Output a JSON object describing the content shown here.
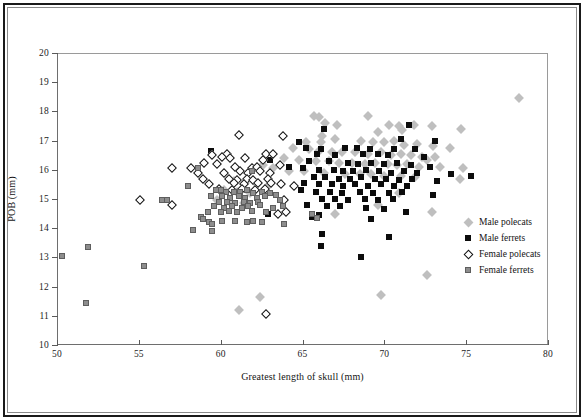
{
  "chart_data": {
    "type": "scatter",
    "title": "",
    "xlabel": "Greatest length of skull (mm)",
    "ylabel": "POB (mm)",
    "xlim": [
      50,
      80
    ],
    "ylim": [
      10,
      20
    ],
    "xticks": [
      50,
      55,
      60,
      65,
      70,
      75,
      80
    ],
    "yticks": [
      10,
      11,
      12,
      13,
      14,
      15,
      16,
      17,
      18,
      19,
      20
    ],
    "grid": false,
    "legend_position": "right-middle",
    "series": [
      {
        "name": "Male polecats",
        "marker": "diamond",
        "color": "#bfbfbf",
        "points": [
          [
            78.2,
            18.45
          ],
          [
            65.7,
            17.85
          ],
          [
            66.0,
            17.8
          ],
          [
            66.4,
            17.6
          ],
          [
            69.0,
            17.85
          ],
          [
            67.1,
            17.55
          ],
          [
            70.3,
            17.55
          ],
          [
            70.9,
            17.5
          ],
          [
            71.8,
            17.55
          ],
          [
            72.9,
            17.5
          ],
          [
            74.7,
            17.4
          ],
          [
            71.1,
            17.35
          ],
          [
            69.6,
            17.3
          ],
          [
            66.2,
            17.15
          ],
          [
            67.0,
            17.05
          ],
          [
            65.2,
            16.95
          ],
          [
            66.1,
            16.95
          ],
          [
            68.6,
            17.0
          ],
          [
            69.3,
            16.95
          ],
          [
            70.0,
            16.95
          ],
          [
            70.6,
            17.0
          ],
          [
            71.2,
            16.85
          ],
          [
            72.0,
            16.9
          ],
          [
            73.0,
            16.8
          ],
          [
            74.0,
            16.75
          ],
          [
            64.4,
            16.75
          ],
          [
            65.4,
            16.7
          ],
          [
            66.0,
            16.65
          ],
          [
            66.8,
            16.6
          ],
          [
            67.4,
            16.6
          ],
          [
            68.2,
            16.6
          ],
          [
            69.0,
            16.55
          ],
          [
            69.8,
            16.6
          ],
          [
            70.4,
            16.5
          ],
          [
            71.0,
            16.55
          ],
          [
            71.6,
            16.5
          ],
          [
            72.3,
            16.45
          ],
          [
            73.1,
            16.45
          ],
          [
            72.6,
            16.35
          ],
          [
            63.9,
            16.4
          ],
          [
            64.8,
            16.35
          ],
          [
            65.8,
            16.3
          ],
          [
            66.6,
            16.3
          ],
          [
            67.2,
            16.25
          ],
          [
            68.0,
            16.25
          ],
          [
            68.8,
            16.2
          ],
          [
            69.4,
            16.25
          ],
          [
            70.2,
            16.2
          ],
          [
            70.8,
            16.15
          ],
          [
            71.4,
            16.2
          ],
          [
            72.1,
            16.1
          ],
          [
            73.4,
            16.1
          ],
          [
            74.8,
            16.05
          ],
          [
            62.6,
            16.15
          ],
          [
            63.2,
            16.05
          ],
          [
            64.2,
            15.95
          ],
          [
            65.1,
            15.95
          ],
          [
            66.3,
            15.9
          ],
          [
            67.6,
            15.85
          ],
          [
            68.5,
            15.85
          ],
          [
            69.2,
            15.85
          ],
          [
            70.0,
            15.8
          ],
          [
            71.0,
            15.8
          ],
          [
            71.9,
            15.75
          ],
          [
            74.6,
            15.7
          ],
          [
            60.8,
            15.6
          ],
          [
            61.5,
            15.55
          ],
          [
            62.2,
            15.5
          ],
          [
            62.9,
            15.45
          ],
          [
            60.2,
            15.3
          ],
          [
            61.0,
            15.25
          ],
          [
            61.8,
            15.2
          ],
          [
            70.9,
            15.2
          ],
          [
            59.8,
            14.95
          ],
          [
            60.6,
            14.9
          ],
          [
            61.4,
            14.85
          ],
          [
            69.6,
            14.8
          ],
          [
            72.9,
            14.55
          ],
          [
            67.0,
            14.5
          ],
          [
            72.6,
            12.4
          ],
          [
            69.8,
            11.7
          ],
          [
            62.4,
            11.65
          ],
          [
            61.1,
            11.2
          ]
        ]
      },
      {
        "name": "Male ferrets",
        "marker": "square",
        "color": "#0c0c0c",
        "points": [
          [
            71.5,
            17.55
          ],
          [
            66.3,
            17.4
          ],
          [
            64.8,
            16.95
          ],
          [
            71.0,
            17.05
          ],
          [
            73.1,
            17.0
          ],
          [
            65.2,
            16.75
          ],
          [
            66.1,
            16.7
          ],
          [
            67.6,
            16.75
          ],
          [
            68.3,
            16.75
          ],
          [
            69.1,
            16.7
          ],
          [
            70.6,
            16.7
          ],
          [
            71.9,
            16.7
          ],
          [
            59.4,
            16.65
          ],
          [
            65.9,
            16.55
          ],
          [
            67.0,
            16.5
          ],
          [
            68.7,
            16.55
          ],
          [
            69.6,
            16.55
          ],
          [
            70.2,
            16.5
          ],
          [
            72.4,
            16.45
          ],
          [
            63.0,
            16.35
          ],
          [
            65.4,
            16.3
          ],
          [
            66.6,
            16.3
          ],
          [
            67.8,
            16.25
          ],
          [
            68.4,
            16.2
          ],
          [
            69.2,
            16.25
          ],
          [
            70.0,
            16.2
          ],
          [
            70.8,
            16.25
          ],
          [
            71.6,
            16.15
          ],
          [
            72.8,
            16.1
          ],
          [
            64.2,
            16.1
          ],
          [
            65.0,
            16.05
          ],
          [
            66.0,
            16.0
          ],
          [
            66.9,
            16.0
          ],
          [
            67.5,
            15.95
          ],
          [
            68.1,
            15.95
          ],
          [
            68.9,
            16.0
          ],
          [
            69.7,
            15.95
          ],
          [
            70.4,
            15.9
          ],
          [
            71.2,
            15.95
          ],
          [
            72.0,
            15.9
          ],
          [
            74.1,
            15.85
          ],
          [
            75.3,
            15.8
          ],
          [
            65.7,
            15.75
          ],
          [
            66.4,
            15.75
          ],
          [
            67.2,
            15.7
          ],
          [
            67.9,
            15.7
          ],
          [
            68.6,
            15.75
          ],
          [
            69.4,
            15.7
          ],
          [
            70.1,
            15.7
          ],
          [
            70.9,
            15.65
          ],
          [
            71.7,
            15.7
          ],
          [
            73.2,
            15.6
          ],
          [
            65.1,
            15.55
          ],
          [
            66.0,
            15.5
          ],
          [
            66.8,
            15.5
          ],
          [
            67.5,
            15.45
          ],
          [
            68.2,
            15.5
          ],
          [
            69.0,
            15.45
          ],
          [
            69.8,
            15.5
          ],
          [
            70.6,
            15.45
          ],
          [
            71.4,
            15.45
          ],
          [
            64.9,
            15.3
          ],
          [
            65.8,
            15.25
          ],
          [
            66.7,
            15.25
          ],
          [
            67.4,
            15.2
          ],
          [
            68.5,
            15.25
          ],
          [
            69.3,
            15.2
          ],
          [
            70.3,
            15.2
          ],
          [
            71.1,
            15.25
          ],
          [
            73.0,
            15.15
          ],
          [
            66.2,
            15.0
          ],
          [
            67.0,
            15.0
          ],
          [
            67.8,
            14.95
          ],
          [
            68.8,
            15.0
          ],
          [
            69.6,
            14.95
          ],
          [
            70.5,
            15.0
          ],
          [
            65.3,
            14.8
          ],
          [
            66.5,
            14.75
          ],
          [
            67.3,
            14.75
          ],
          [
            68.9,
            14.7
          ],
          [
            70.0,
            14.65
          ],
          [
            71.3,
            14.55
          ],
          [
            62.9,
            14.5
          ],
          [
            66.0,
            14.45
          ],
          [
            65.6,
            14.4
          ],
          [
            69.2,
            14.3
          ],
          [
            66.2,
            13.8
          ],
          [
            70.3,
            13.7
          ],
          [
            66.1,
            13.4
          ],
          [
            68.6,
            13.0
          ]
        ]
      },
      {
        "name": "Female polecats",
        "marker": "open-diamond",
        "color": "#ffffff",
        "points": [
          [
            61.1,
            17.2
          ],
          [
            63.8,
            17.15
          ],
          [
            59.5,
            16.5
          ],
          [
            60.4,
            16.55
          ],
          [
            62.8,
            16.55
          ],
          [
            63.2,
            16.55
          ],
          [
            57.0,
            16.05
          ],
          [
            60.1,
            16.45
          ],
          [
            60.6,
            16.4
          ],
          [
            61.5,
            16.4
          ],
          [
            62.6,
            16.35
          ],
          [
            59.0,
            16.25
          ],
          [
            59.8,
            16.2
          ],
          [
            58.2,
            16.05
          ],
          [
            60.9,
            16.1
          ],
          [
            61.9,
            16.05
          ],
          [
            62.2,
            16.1
          ],
          [
            63.6,
            16.15
          ],
          [
            58.6,
            15.9
          ],
          [
            60.2,
            15.9
          ],
          [
            61.2,
            15.95
          ],
          [
            61.7,
            15.9
          ],
          [
            62.4,
            15.95
          ],
          [
            63.0,
            15.9
          ],
          [
            58.9,
            15.7
          ],
          [
            60.5,
            15.7
          ],
          [
            61.0,
            15.65
          ],
          [
            61.6,
            15.7
          ],
          [
            62.0,
            15.65
          ],
          [
            62.9,
            15.7
          ],
          [
            59.3,
            15.5
          ],
          [
            60.8,
            15.55
          ],
          [
            61.4,
            15.5
          ],
          [
            62.3,
            15.55
          ],
          [
            63.1,
            15.55
          ],
          [
            63.7,
            15.5
          ],
          [
            64.5,
            15.45
          ],
          [
            59.9,
            15.35
          ],
          [
            60.7,
            15.3
          ],
          [
            61.3,
            15.35
          ],
          [
            62.1,
            15.3
          ],
          [
            62.7,
            15.35
          ],
          [
            55.1,
            14.95
          ],
          [
            57.0,
            14.8
          ],
          [
            63.9,
            14.95
          ],
          [
            64.0,
            14.55
          ],
          [
            63.5,
            14.5
          ],
          [
            62.8,
            11.05
          ]
        ]
      },
      {
        "name": "Female ferrets",
        "marker": "square",
        "color": "#8d8d8d",
        "points": [
          [
            56.4,
            14.95
          ],
          [
            56.7,
            14.95
          ],
          [
            58.6,
            16.05
          ],
          [
            58.0,
            15.45
          ],
          [
            61.9,
            15.95
          ],
          [
            59.7,
            15.3
          ],
          [
            60.0,
            15.3
          ],
          [
            60.3,
            15.25
          ],
          [
            60.8,
            15.25
          ],
          [
            61.2,
            15.25
          ],
          [
            61.6,
            15.3
          ],
          [
            62.0,
            15.2
          ],
          [
            62.5,
            15.25
          ],
          [
            63.0,
            15.2
          ],
          [
            59.4,
            15.1
          ],
          [
            60.1,
            15.1
          ],
          [
            60.6,
            15.05
          ],
          [
            61.1,
            15.1
          ],
          [
            61.5,
            15.05
          ],
          [
            62.2,
            15.05
          ],
          [
            62.7,
            15.1
          ],
          [
            63.4,
            15.15
          ],
          [
            59.9,
            14.9
          ],
          [
            60.4,
            14.9
          ],
          [
            60.9,
            14.85
          ],
          [
            61.4,
            14.9
          ],
          [
            61.8,
            14.85
          ],
          [
            62.3,
            14.9
          ],
          [
            63.6,
            14.95
          ],
          [
            59.6,
            14.75
          ],
          [
            60.2,
            14.7
          ],
          [
            60.7,
            14.75
          ],
          [
            61.3,
            14.7
          ],
          [
            61.7,
            14.75
          ],
          [
            62.4,
            14.8
          ],
          [
            63.2,
            14.7
          ],
          [
            63.8,
            14.75
          ],
          [
            59.2,
            14.55
          ],
          [
            60.0,
            14.55
          ],
          [
            60.5,
            14.6
          ],
          [
            61.0,
            14.55
          ],
          [
            61.9,
            14.6
          ],
          [
            62.8,
            14.55
          ],
          [
            65.6,
            14.5
          ],
          [
            65.9,
            14.35
          ],
          [
            58.8,
            14.4
          ],
          [
            58.9,
            14.3
          ],
          [
            59.3,
            14.2
          ],
          [
            59.5,
            14.15
          ],
          [
            60.1,
            14.25
          ],
          [
            60.9,
            14.25
          ],
          [
            61.6,
            14.2
          ],
          [
            62.0,
            14.25
          ],
          [
            62.5,
            14.2
          ],
          [
            63.9,
            14.15
          ],
          [
            58.3,
            13.95
          ],
          [
            59.5,
            13.9
          ],
          [
            51.9,
            13.35
          ],
          [
            50.3,
            13.05
          ],
          [
            55.3,
            12.7
          ],
          [
            51.8,
            11.45
          ]
        ]
      }
    ]
  },
  "legend": {
    "entries": [
      {
        "label": "Male polecats",
        "marker": "diamond",
        "style": "m-mp"
      },
      {
        "label": "Male ferrets",
        "marker": "square",
        "style": "m-mf"
      },
      {
        "label": "Female polecats",
        "marker": "open-diamond",
        "style": "m-fp"
      },
      {
        "label": "Female ferrets",
        "marker": "square",
        "style": "m-ff"
      }
    ]
  }
}
